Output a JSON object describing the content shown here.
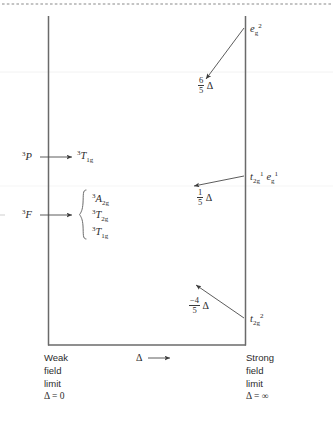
{
  "figure": {
    "type": "correlation-diagram",
    "axis_label": "Δ",
    "left_axis": {
      "line1": "Weak",
      "line2": "field",
      "line3": "limit",
      "line4": "Δ = 0"
    },
    "right_axis": {
      "line1": "Strong",
      "line2": "field",
      "line3": "limit",
      "line4": "Δ = ∞"
    }
  },
  "weak_field": {
    "terms": [
      {
        "name": "free-ion-term-P",
        "multiplicity": "3",
        "symbol": "P",
        "sub": "",
        "splits_into": [
          {
            "multiplicity": "3",
            "symbol": "T",
            "sub": "1g"
          }
        ]
      },
      {
        "name": "free-ion-term-F",
        "multiplicity": "3",
        "symbol": "F",
        "sub": "",
        "splits_into": [
          {
            "multiplicity": "3",
            "symbol": "A",
            "sub": "2g"
          },
          {
            "multiplicity": "3",
            "symbol": "T",
            "sub": "2g"
          },
          {
            "multiplicity": "3",
            "symbol": "T",
            "sub": "1g"
          }
        ]
      }
    ]
  },
  "strong_field": {
    "configurations": [
      {
        "name": "config-eg2",
        "parts": [
          {
            "sym": "e",
            "sub": "g",
            "sup": "2"
          }
        ],
        "energy": {
          "num": "6",
          "den": "5",
          "sign": "",
          "unit": "Δ"
        }
      },
      {
        "name": "config-t2g1-eg1",
        "parts": [
          {
            "sym": "t",
            "sub": "2g",
            "sup": "1"
          },
          {
            "sym": "e",
            "sub": "g",
            "sup": "1"
          }
        ],
        "energy": {
          "num": "1",
          "den": "5",
          "sign": "",
          "unit": "Δ"
        }
      },
      {
        "name": "config-t2g2",
        "parts": [
          {
            "sym": "t",
            "sub": "2g",
            "sup": "2"
          }
        ],
        "energy": {
          "num": "4",
          "den": "5",
          "sign": "−",
          "unit": "Δ"
        }
      }
    ]
  },
  "colors": {
    "line": "#6a6a6a",
    "text": "#2b2b2b",
    "arrow": "#4a4a4a",
    "dotted_rule": "#7a7a7a"
  }
}
